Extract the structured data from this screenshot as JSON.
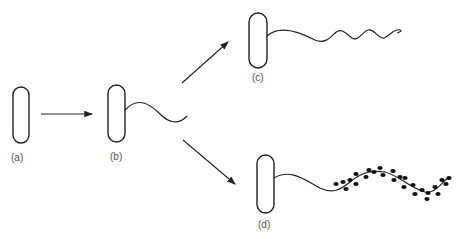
{
  "diagram": {
    "labels": {
      "a": "(a)",
      "b": "(b)",
      "c": "(c)",
      "d": "(d)"
    },
    "stages": [
      {
        "id": "a",
        "description": "cell without flagellum"
      },
      {
        "id": "b",
        "description": "cell with short flagellum"
      },
      {
        "id": "c",
        "description": "cell with long wavy flagellum"
      },
      {
        "id": "d",
        "description": "cell with flagellum coated by particles"
      }
    ],
    "colors": {
      "stroke": "#222222",
      "label": "#555555",
      "background": "#ffffff"
    }
  }
}
